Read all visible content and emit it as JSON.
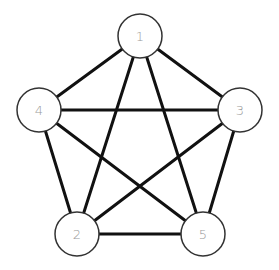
{
  "graph": {
    "type": "complete-graph-K5",
    "node_radius": 22,
    "colors": {
      "edge": "#111111",
      "node_stroke": "#333333",
      "node_fill": "#ffffff",
      "label": "#9a9a9a"
    },
    "nodes": [
      {
        "id": "1",
        "label": "1",
        "x": 140,
        "y": 36
      },
      {
        "id": "2",
        "label": "2",
        "x": 77,
        "y": 234
      },
      {
        "id": "3",
        "label": "3",
        "x": 240,
        "y": 110
      },
      {
        "id": "4",
        "label": "4",
        "x": 39,
        "y": 110
      },
      {
        "id": "5",
        "label": "5",
        "x": 203,
        "y": 234
      }
    ],
    "edges": [
      [
        "1",
        "4"
      ],
      [
        "1",
        "3"
      ],
      [
        "1",
        "2"
      ],
      [
        "1",
        "5"
      ],
      [
        "4",
        "3"
      ],
      [
        "4",
        "2"
      ],
      [
        "4",
        "5"
      ],
      [
        "3",
        "2"
      ],
      [
        "3",
        "5"
      ],
      [
        "2",
        "5"
      ]
    ]
  }
}
